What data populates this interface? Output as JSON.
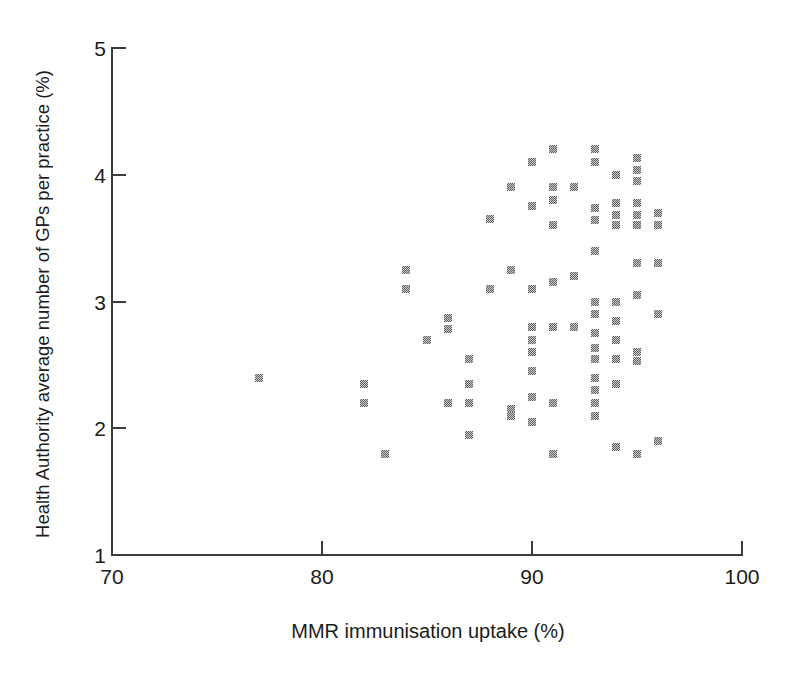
{
  "figure": {
    "y_axis_title": "Health Authority average number of GPs per practice (%)",
    "x_axis_title": "MMR immunisation uptake (%)"
  },
  "chart_data": {
    "type": "scatter",
    "title": "",
    "xlabel": "MMR immunisation uptake (%)",
    "ylabel": "Health Authority average number of GPs per practice (%)",
    "xlim": [
      70,
      100
    ],
    "ylim": [
      1,
      5
    ],
    "x_ticks": [
      70,
      80,
      90,
      100
    ],
    "y_ticks": [
      1,
      2,
      3,
      4,
      5
    ],
    "grid": false,
    "legend": null,
    "marker": {
      "shape": "square",
      "color_hex": "#8c8c8c"
    },
    "points": [
      [
        91,
        4.2
      ],
      [
        90,
        4.1
      ],
      [
        89,
        3.9
      ],
      [
        91,
        3.9
      ],
      [
        91,
        3.8
      ],
      [
        90,
        3.75
      ],
      [
        88,
        3.65
      ],
      [
        91,
        3.6
      ],
      [
        93,
        4.2
      ],
      [
        93,
        4.1
      ],
      [
        94,
        4.0
      ],
      [
        95,
        4.13
      ],
      [
        95,
        4.04
      ],
      [
        95,
        3.95
      ],
      [
        92,
        3.9
      ],
      [
        93,
        3.74
      ],
      [
        93,
        3.64
      ],
      [
        94,
        3.78
      ],
      [
        94,
        3.68
      ],
      [
        94,
        3.6
      ],
      [
        95,
        3.78
      ],
      [
        95,
        3.68
      ],
      [
        95,
        3.6
      ],
      [
        96,
        3.7
      ],
      [
        96,
        3.6
      ],
      [
        84,
        3.25
      ],
      [
        84,
        3.1
      ],
      [
        85,
        2.7
      ],
      [
        89,
        3.25
      ],
      [
        88,
        3.1
      ],
      [
        90,
        3.1
      ],
      [
        91,
        3.15
      ],
      [
        86,
        2.87
      ],
      [
        86,
        2.78
      ],
      [
        90,
        2.8
      ],
      [
        90,
        2.7
      ],
      [
        90,
        2.6
      ],
      [
        91,
        2.8
      ],
      [
        87,
        2.55
      ],
      [
        93,
        3.4
      ],
      [
        92,
        3.2
      ],
      [
        95,
        3.3
      ],
      [
        96,
        3.3
      ],
      [
        93,
        3.0
      ],
      [
        93,
        2.9
      ],
      [
        94,
        3.0
      ],
      [
        94,
        2.85
      ],
      [
        95,
        3.05
      ],
      [
        96,
        2.9
      ],
      [
        92,
        2.8
      ],
      [
        93,
        2.75
      ],
      [
        94,
        2.7
      ],
      [
        93,
        2.63
      ],
      [
        93,
        2.55
      ],
      [
        94,
        2.55
      ],
      [
        95,
        2.6
      ],
      [
        95,
        2.53
      ],
      [
        77,
        2.4
      ],
      [
        82,
        2.35
      ],
      [
        82,
        2.2
      ],
      [
        83,
        1.8
      ],
      [
        90,
        2.45
      ],
      [
        87,
        2.35
      ],
      [
        87,
        2.2
      ],
      [
        86,
        2.2
      ],
      [
        90,
        2.25
      ],
      [
        91,
        2.2
      ],
      [
        89,
        2.15
      ],
      [
        89,
        2.1
      ],
      [
        90,
        2.05
      ],
      [
        87,
        1.95
      ],
      [
        91,
        1.8
      ],
      [
        93,
        2.4
      ],
      [
        93,
        2.3
      ],
      [
        93,
        2.2
      ],
      [
        93,
        2.1
      ],
      [
        94,
        2.35
      ],
      [
        94,
        1.85
      ],
      [
        95,
        1.8
      ],
      [
        96,
        1.9
      ]
    ]
  }
}
